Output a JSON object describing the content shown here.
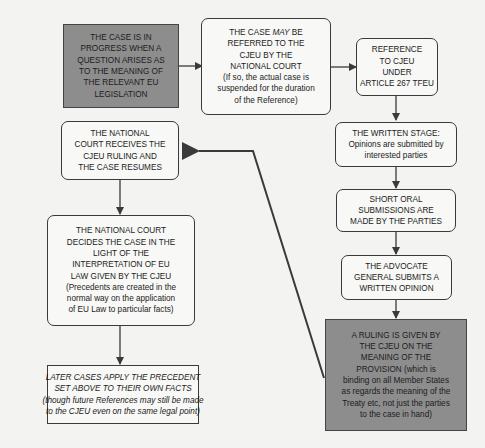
{
  "diagram": {
    "nodes": {
      "case_in_progress": {
        "lines": [
          "THE CASE IS IN",
          "PROGRESS WHEN A",
          "QUESTION ARISES AS",
          "TO THE MEANING OF",
          "THE RELEVANT EU",
          "LEGISLATION"
        ]
      },
      "may_be_referred": {
        "line1_prefix": "THE CASE ",
        "line1_emph": "MAY",
        "line1_suffix": " BE",
        "lines": [
          "REFERRED TO THE",
          "CJEU BY THE",
          "NATIONAL COURT"
        ],
        "note": [
          "(If so, the actual case is",
          "suspended for the duration",
          "of the Reference)"
        ]
      },
      "reference_article": {
        "lines": [
          "REFERENCE",
          "TO CJEU",
          "UNDER",
          "ARTICLE 267 TFEU"
        ]
      },
      "written_stage": {
        "lines": [
          "THE WRITTEN STAGE:"
        ],
        "note": [
          "Opinions are submitted by",
          "interested parties"
        ]
      },
      "oral_submissions": {
        "lines": [
          "SHORT ORAL",
          "SUBMISSIONS ARE",
          "MADE BY THE PARTIES"
        ]
      },
      "advocate_general": {
        "lines": [
          "THE ADVOCATE",
          "GENERAL SUBMITS A",
          "WRITTEN OPINION"
        ]
      },
      "ruling_given": {
        "lines": [
          "A RULING IS GIVEN BY",
          "THE CJEU ON THE",
          "MEANING OF THE",
          "PROVISION (which is",
          "binding on all Member States",
          "as regards the meaning of the",
          "Treaty etc, not just the parties",
          "to the case in hand)"
        ]
      },
      "court_receives": {
        "lines": [
          "THE NATIONAL",
          "COURT RECEIVES THE",
          "CJEU RULING AND",
          "THE CASE RESUMES"
        ]
      },
      "court_decides": {
        "lines": [
          "THE NATIONAL COURT",
          "DECIDES THE CASE IN THE",
          "LIGHT OF THE",
          "INTERPRETATION OF EU",
          "LAW GIVEN BY THE CJEU"
        ],
        "note": [
          "(Precedents are created in the",
          "normal way on the application",
          "of EU Law to particular facts)"
        ]
      },
      "later_cases": {
        "lines": [
          "LATER CASES APPLY THE PRECEDENT",
          "SET ABOVE TO THEIR OWN FACTS"
        ],
        "note": [
          "(though future References may still be made",
          "to the CJEU even on the same legal point)"
        ]
      }
    },
    "colors": {
      "shaded_fill": "#8d8d8d",
      "box_fill": "#f8f8f6",
      "background": "#f3f3f1",
      "stroke": "#3a3a3a"
    }
  }
}
